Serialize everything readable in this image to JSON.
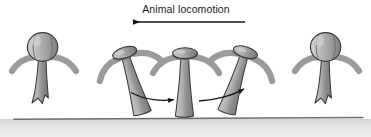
{
  "figure": {
    "title": "Animal locomotion",
    "direction_arrow": {
      "name": "locomotion-direction-arrow",
      "points": "left",
      "x_start": 245,
      "x_end": 131,
      "y": 22
    },
    "ground": {
      "label": "substrate",
      "top_y": 118,
      "edge_color": "#6e6e6e",
      "fill_color": "#e2e2e2"
    },
    "colors": {
      "body_light": "#bdbdbd",
      "body_mid": "#9a9a9a",
      "body_dark": "#7a7a7a",
      "outline": "#3a3a3a",
      "wing_gray": "#9b9b9b",
      "arrow_black": "#141414",
      "background": "#ffffff"
    },
    "organisms": [
      {
        "id": "organism-1",
        "label": "detached-upright-left",
        "posture": "detached",
        "lean_deg": 0,
        "cx": 44,
        "head_type": "round-bell",
        "touches_ground": false
      },
      {
        "id": "organism-2",
        "label": "planted-leaning-left",
        "posture": "planted",
        "lean_deg": -18,
        "cx": 120,
        "head_type": "flat-cap",
        "touches_ground": true
      },
      {
        "id": "organism-3",
        "label": "planted-upright-middle",
        "posture": "planted",
        "lean_deg": 0,
        "cx": 186,
        "head_type": "flat-cap",
        "touches_ground": true
      },
      {
        "id": "organism-4",
        "label": "planted-leaning-right",
        "posture": "planted",
        "lean_deg": 18,
        "cx": 252,
        "head_type": "flat-cap",
        "touches_ground": true
      },
      {
        "id": "organism-5",
        "label": "detached-upright-right",
        "posture": "detached",
        "lean_deg": 0,
        "cx": 327,
        "head_type": "round-bell",
        "touches_ground": false
      }
    ],
    "step_arrows": [
      {
        "id": "step-arrow-1",
        "label": "step-arrow-left-to-middle",
        "direction": "right",
        "curvature": "arc-down",
        "x_start": 130,
        "x_end": 176,
        "y": 96
      },
      {
        "id": "step-arrow-2",
        "label": "step-arrow-middle-to-right",
        "direction": "right",
        "curvature": "arc-up",
        "x_start": 200,
        "x_end": 247,
        "y": 96
      }
    ]
  }
}
